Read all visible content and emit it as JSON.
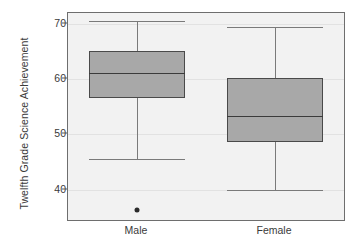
{
  "chart_data": {
    "type": "box",
    "title": "",
    "xlabel": "",
    "ylabel": "Twelfth Grade Science Achievement",
    "ylim": [
      34.5,
      72
    ],
    "yticks": [
      40,
      50,
      60,
      70
    ],
    "ytick_labels": [
      "40",
      "50",
      "60",
      "70"
    ],
    "grid": true,
    "legend": "none",
    "categories": [
      "Male",
      "Female"
    ],
    "boxes": [
      {
        "label": "Male",
        "whisker_low": 45.5,
        "q1": 56.6,
        "median": 61.2,
        "q3": 65.1,
        "whisker_high": 70.5,
        "outliers": [
          36.4
        ]
      },
      {
        "label": "Female",
        "whisker_low": 40.0,
        "q1": 48.6,
        "median": 53.4,
        "q3": 60.2,
        "whisker_high": 69.4,
        "outliers": []
      }
    ],
    "colors": {
      "box_fill": "#a8a8a8",
      "box_border": "#4a4a4a",
      "median": "#3b3b3b",
      "whisker": "#7a7a7a",
      "outlier": "#2b2b2b",
      "plot_background": "#f2f2f2",
      "plot_border": "#6e6e6e",
      "gridline": "#e2e2e2",
      "text": "#3a3a3a",
      "page_background": "#ffffff"
    }
  }
}
